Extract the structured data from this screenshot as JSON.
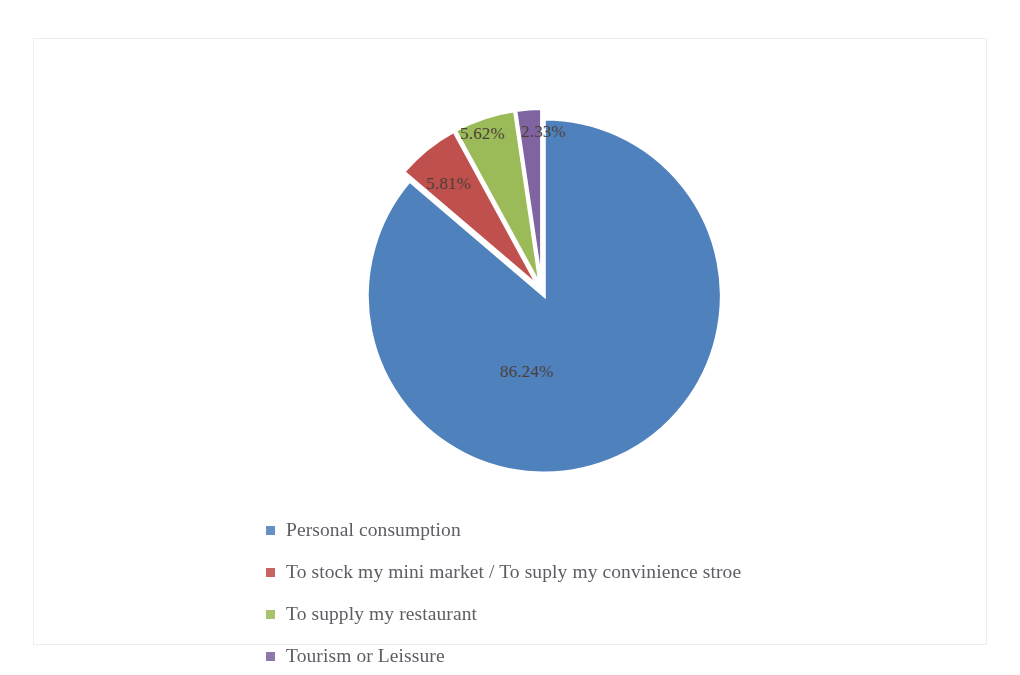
{
  "chart_data": {
    "type": "pie",
    "title": "",
    "subtitle": "",
    "xlabel": "",
    "ylabel": "",
    "legend_position": "bottom-left",
    "exploded": true,
    "grid": false,
    "categories": [
      "Personal consumption",
      "To stock my mini market / To suply my convinience stroe",
      "To supply my restaurant",
      "Tourism  or Leissure"
    ],
    "values": [
      86.24,
      5.81,
      5.62,
      2.33
    ],
    "value_labels": [
      "86.24%",
      "5.81%",
      "5.62%",
      "2.33%"
    ],
    "colors": [
      "#4F81BD",
      "#C0504D",
      "#9BBB59",
      "#8064A2"
    ],
    "units": "percent"
  },
  "chart": {
    "slices": [
      {
        "label": "86.24%",
        "value": 86.24,
        "color": "#4F81BD",
        "name": "Personal consumption"
      },
      {
        "label": "5.81%",
        "value": 5.81,
        "color": "#C0504D",
        "name": "To stock my mini market / To suply my convinience stroe"
      },
      {
        "label": "5.62%",
        "value": 5.62,
        "color": "#9BBB59",
        "name": "To supply my restaurant"
      },
      {
        "label": "2.33%",
        "value": 2.33,
        "color": "#8064A2",
        "name": "Tourism  or Leissure"
      }
    ]
  },
  "legend": {
    "items": [
      {
        "label": "Personal consumption",
        "color": "#4F81BD"
      },
      {
        "label": "To stock my mini market / To suply my convinience stroe",
        "color": "#C0504D"
      },
      {
        "label": "To supply my restaurant",
        "color": "#9BBB59"
      },
      {
        "label": "Tourism  or Leissure",
        "color": "#8064A2"
      }
    ]
  }
}
